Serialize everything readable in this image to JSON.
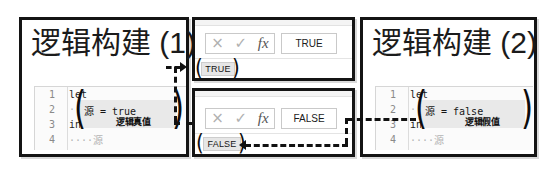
{
  "panels": {
    "left": {
      "title": "逻辑构建 (1)",
      "code": {
        "lines": [
          {
            "num": "1",
            "text": "let"
          },
          {
            "num": "2",
            "text": "····"
          },
          {
            "num": "3",
            "text": "in"
          },
          {
            "num": "4",
            "text": "····源"
          }
        ],
        "highlight_code": "源 = true",
        "highlight_note": "逻辑真值"
      }
    },
    "right": {
      "title": "逻辑构建 (2)",
      "code": {
        "lines": [
          {
            "num": "1",
            "text": "let"
          },
          {
            "num": "2",
            "text": "····"
          },
          {
            "num": "3",
            "text": "in"
          },
          {
            "num": "4",
            "text": "····源"
          }
        ],
        "highlight_code": "源 = false",
        "highlight_note": "逻辑假值"
      }
    },
    "middle_top": {
      "cancel_icon": "×",
      "confirm_icon": "✓",
      "function_icon": "fx",
      "cell_value": "TRUE",
      "badge": "TRUE"
    },
    "middle_bottom": {
      "cancel_icon": "×",
      "confirm_icon": "✓",
      "function_icon": "fx",
      "cell_value": "FALSE",
      "badge": "FALSE"
    }
  },
  "colors": {
    "border": "#141414",
    "highlight": "#e9e9e9",
    "gutter_text": "#8a8a8a",
    "connector": "#111111"
  }
}
